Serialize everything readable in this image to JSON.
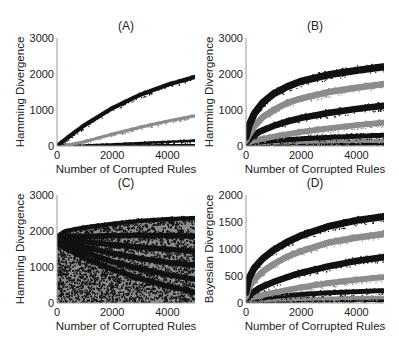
{
  "figure": {
    "width": 399,
    "height": 345,
    "series_colors": {
      "black": "#111111",
      "gray": "#8c8c8c",
      "axis": "#9a9a9a",
      "text": "#222222"
    }
  },
  "chart_data": [
    {
      "id": "A",
      "type": "scatter",
      "title": "(A)",
      "xlabel": "Number of Corrupted Rules",
      "ylabel": "Hamming Divergence",
      "xlim": [
        0,
        5000
      ],
      "ylim": [
        0,
        3000
      ],
      "xticks": [
        0,
        2000,
        4000
      ],
      "yticks": [
        0,
        1000,
        2000,
        3000
      ],
      "grid": false,
      "box": {
        "left": 57,
        "top": 38,
        "right": 195,
        "bottom": 146
      },
      "series": [
        {
          "name": "band-1",
          "color": "black",
          "thickness": 120,
          "x": [
            0,
            500,
            1000,
            2000,
            3000,
            4000,
            5000
          ],
          "values": [
            0,
            300,
            580,
            1050,
            1420,
            1700,
            1920
          ]
        },
        {
          "name": "band-2",
          "color": "gray",
          "thickness": 90,
          "x": [
            0,
            500,
            1000,
            2000,
            3000,
            4000,
            5000
          ],
          "values": [
            0,
            40,
            120,
            330,
            520,
            690,
            840
          ]
        },
        {
          "name": "band-3",
          "color": "black",
          "thickness": 70,
          "x": [
            0,
            1000,
            2000,
            3000,
            4000,
            5000
          ],
          "values": [
            0,
            15,
            45,
            80,
            115,
            150
          ]
        },
        {
          "name": "band-4",
          "color": "black",
          "thickness": 60,
          "x": [
            0,
            5000
          ],
          "values": [
            10,
            25
          ]
        }
      ]
    },
    {
      "id": "B",
      "type": "scatter",
      "title": "(B)",
      "xlabel": "Number of Corrupted Rules",
      "ylabel": "Hamming Divergence",
      "xlim": [
        0,
        5000
      ],
      "ylim": [
        0,
        3000
      ],
      "xticks": [
        0,
        2000,
        4000
      ],
      "yticks": [
        0,
        1000,
        2000,
        3000
      ],
      "grid": false,
      "box": {
        "left": 246,
        "top": 38,
        "right": 384,
        "bottom": 146
      },
      "series": [
        {
          "name": "band-1",
          "color": "black",
          "thickness": 200,
          "x": [
            0,
            100,
            300,
            600,
            1000,
            1500,
            2000,
            3000,
            4000,
            5000
          ],
          "values": [
            250,
            550,
            900,
            1200,
            1450,
            1650,
            1800,
            1980,
            2100,
            2200
          ]
        },
        {
          "name": "band-2",
          "color": "gray",
          "thickness": 180,
          "x": [
            0,
            100,
            300,
            600,
            1000,
            1500,
            2000,
            3000,
            4000,
            5000
          ],
          "values": [
            150,
            300,
            550,
            800,
            1000,
            1200,
            1320,
            1500,
            1620,
            1720
          ]
        },
        {
          "name": "band-3",
          "color": "black",
          "thickness": 180,
          "x": [
            0,
            200,
            500,
            1000,
            1500,
            2000,
            3000,
            4000,
            5000
          ],
          "values": [
            100,
            250,
            400,
            560,
            680,
            780,
            920,
            1030,
            1120
          ]
        },
        {
          "name": "band-4",
          "color": "gray",
          "thickness": 160,
          "x": [
            0,
            300,
            800,
            1500,
            2000,
            3000,
            4000,
            5000
          ],
          "values": [
            80,
            150,
            230,
            330,
            390,
            490,
            580,
            650
          ]
        },
        {
          "name": "band-5",
          "color": "black",
          "thickness": 140,
          "x": [
            0,
            500,
            1000,
            2000,
            3000,
            4000,
            5000
          ],
          "values": [
            60,
            110,
            150,
            200,
            240,
            270,
            300
          ]
        },
        {
          "name": "band-6",
          "color": "gray",
          "thickness": 100,
          "x": [
            0,
            1000,
            2000,
            3000,
            4000,
            5000
          ],
          "values": [
            50,
            90,
            110,
            125,
            140,
            150
          ]
        },
        {
          "name": "band-7",
          "color": "black",
          "thickness": 80,
          "x": [
            0,
            2500,
            5000
          ],
          "values": [
            30,
            50,
            60
          ]
        }
      ]
    },
    {
      "id": "C",
      "type": "scatter",
      "title": "(C)",
      "xlabel": "Number of Corrupted Rules",
      "ylabel": "Hamming Divergence",
      "xlim": [
        0,
        5000
      ],
      "ylim": [
        0,
        3000
      ],
      "xticks": [
        0,
        2000,
        4000
      ],
      "yticks": [
        0,
        1000,
        2000,
        3000
      ],
      "grid": false,
      "box": {
        "left": 57,
        "top": 195,
        "right": 195,
        "bottom": 303
      },
      "envelope": {
        "x": [
          0,
          300,
          1000,
          2000,
          3000,
          4000,
          5000
        ],
        "values": [
          1850,
          2000,
          2100,
          2200,
          2280,
          2330,
          2360
        ]
      },
      "series": [
        {
          "name": "band-1",
          "color": "black",
          "thickness": 120,
          "x": [
            0,
            300,
            1000,
            2000,
            3000,
            4000,
            5000
          ],
          "values": [
            1850,
            2000,
            2100,
            2200,
            2280,
            2330,
            2360
          ]
        },
        {
          "name": "band-2",
          "color": "black",
          "thickness": 150,
          "x": [
            0,
            1000,
            2000,
            3000,
            4000,
            5000
          ],
          "values": [
            1850,
            1850,
            1870,
            1880,
            1870,
            1860
          ]
        },
        {
          "name": "band-3",
          "color": "black",
          "thickness": 150,
          "x": [
            0,
            1000,
            2000,
            3000,
            4000,
            5000
          ],
          "values": [
            1800,
            1700,
            1620,
            1550,
            1490,
            1440
          ]
        },
        {
          "name": "band-4",
          "color": "black",
          "thickness": 150,
          "x": [
            0,
            1000,
            2000,
            3000,
            4000,
            5000
          ],
          "values": [
            1750,
            1550,
            1380,
            1240,
            1130,
            1050
          ]
        },
        {
          "name": "band-5",
          "color": "black",
          "thickness": 150,
          "x": [
            0,
            1000,
            2000,
            3000,
            4000,
            5000
          ],
          "values": [
            1700,
            1400,
            1150,
            950,
            790,
            660
          ]
        },
        {
          "name": "band-6",
          "color": "black",
          "thickness": 150,
          "x": [
            0,
            1000,
            2000,
            3000,
            4000,
            5000
          ],
          "values": [
            1650,
            1250,
            930,
            680,
            470,
            300
          ]
        }
      ]
    },
    {
      "id": "D",
      "type": "scatter",
      "title": "(D)",
      "xlabel": "Number of Corrupted Rules",
      "ylabel": "Bayesian Divergence",
      "xlim": [
        0,
        5000
      ],
      "ylim": [
        0,
        2000
      ],
      "xticks": [
        0,
        2000,
        4000
      ],
      "yticks": [
        0,
        500,
        1000,
        1500,
        2000
      ],
      "grid": false,
      "box": {
        "left": 246,
        "top": 195,
        "right": 384,
        "bottom": 303
      },
      "series": [
        {
          "name": "band-1",
          "color": "black",
          "thickness": 130,
          "x": [
            0,
            100,
            300,
            600,
            1000,
            1500,
            2000,
            3000,
            4000,
            5000
          ],
          "values": [
            200,
            450,
            650,
            820,
            980,
            1130,
            1250,
            1420,
            1530,
            1600
          ]
        },
        {
          "name": "band-2",
          "color": "gray",
          "thickness": 120,
          "x": [
            0,
            100,
            300,
            600,
            1000,
            1500,
            2000,
            3000,
            4000,
            5000
          ],
          "values": [
            120,
            280,
            430,
            580,
            720,
            860,
            960,
            1120,
            1210,
            1280
          ]
        },
        {
          "name": "band-3",
          "color": "black",
          "thickness": 120,
          "x": [
            0,
            200,
            500,
            1000,
            1500,
            2000,
            3000,
            4000,
            5000
          ],
          "values": [
            80,
            180,
            280,
            390,
            480,
            560,
            680,
            780,
            850
          ]
        },
        {
          "name": "band-4",
          "color": "gray",
          "thickness": 110,
          "x": [
            0,
            300,
            800,
            1500,
            2000,
            3000,
            4000,
            5000
          ],
          "values": [
            60,
            110,
            170,
            240,
            290,
            370,
            430,
            480
          ]
        },
        {
          "name": "band-5",
          "color": "black",
          "thickness": 90,
          "x": [
            0,
            500,
            1000,
            2000,
            3000,
            4000,
            5000
          ],
          "values": [
            50,
            90,
            120,
            160,
            190,
            210,
            230
          ]
        },
        {
          "name": "band-6",
          "color": "gray",
          "thickness": 70,
          "x": [
            0,
            1000,
            2000,
            3000,
            4000,
            5000
          ],
          "values": [
            40,
            60,
            75,
            85,
            95,
            100
          ]
        },
        {
          "name": "band-7",
          "color": "black",
          "thickness": 60,
          "x": [
            0,
            2500,
            5000
          ],
          "values": [
            20,
            40,
            50
          ]
        }
      ]
    }
  ]
}
